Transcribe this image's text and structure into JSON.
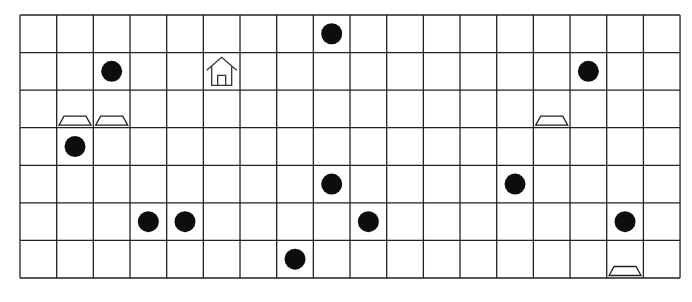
{
  "grid": {
    "columns": 18,
    "rows": 7,
    "cell_width": 36.67,
    "cell_height": 37.57,
    "line_color": "#222222",
    "background": "#ffffff"
  },
  "items": [
    {
      "type": "dot",
      "row": 0,
      "col": 8
    },
    {
      "type": "dot",
      "row": 1,
      "col": 2
    },
    {
      "type": "house",
      "row": 1,
      "col": 5
    },
    {
      "type": "dot",
      "row": 1,
      "col": 15
    },
    {
      "type": "trapezoid",
      "row": 2,
      "col": 1
    },
    {
      "type": "trapezoid",
      "row": 2,
      "col": 2
    },
    {
      "type": "trapezoid",
      "row": 2,
      "col": 14
    },
    {
      "type": "dot",
      "row": 3,
      "col": 1
    },
    {
      "type": "dot",
      "row": 4,
      "col": 8
    },
    {
      "type": "dot",
      "row": 4,
      "col": 13
    },
    {
      "type": "dot",
      "row": 5,
      "col": 3
    },
    {
      "type": "dot",
      "row": 5,
      "col": 4
    },
    {
      "type": "dot",
      "row": 5,
      "col": 9
    },
    {
      "type": "dot",
      "row": 5,
      "col": 16
    },
    {
      "type": "dot",
      "row": 6,
      "col": 7
    },
    {
      "type": "trapezoid",
      "row": 6,
      "col": 16
    }
  ],
  "legend_icons": {
    "dot": "filled-circle-icon",
    "house": "house-icon",
    "trapezoid": "trapezoid-icon"
  },
  "colors": {
    "dot": "#0d0d0d",
    "outline": "#222222"
  }
}
